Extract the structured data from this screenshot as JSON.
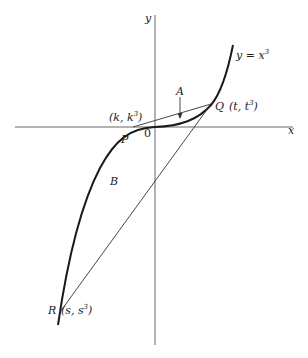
{
  "diagram": {
    "axes": {
      "x_label": "x",
      "y_label": "y",
      "origin_label": "0"
    },
    "curve": {
      "equation_label_lhs": "y = x",
      "equation_label_exp": "3"
    },
    "points": {
      "P": {
        "name": "P",
        "coord_open": "(k, k",
        "coord_exp": "3",
        "coord_close": ")"
      },
      "Q": {
        "name": "Q",
        "coord_open": "(t, t",
        "coord_exp": "3",
        "coord_close": ")"
      },
      "R": {
        "name": "R",
        "coord_open": "(s, s",
        "coord_exp": "3",
        "coord_close": ")"
      }
    },
    "regions": {
      "A": "A",
      "B": "B"
    },
    "colors": {
      "curve": "#1a1a1a",
      "lines": "#333333",
      "axes": "#555555",
      "background": "#ffffff"
    }
  }
}
